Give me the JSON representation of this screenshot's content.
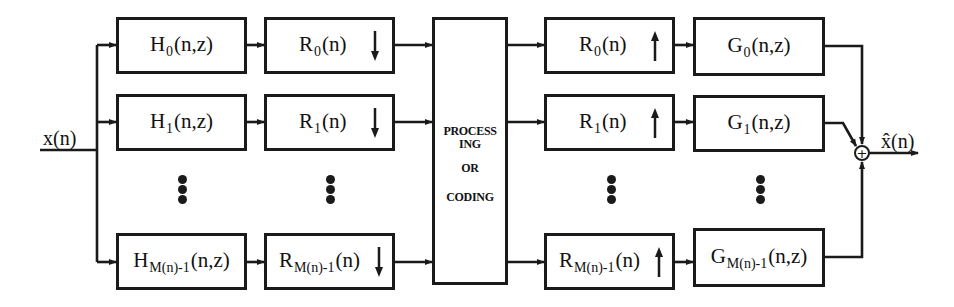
{
  "input": {
    "label": "x(n)"
  },
  "output": {
    "label": "x̂(n)"
  },
  "analysis_filters": [
    {
      "base": "H",
      "sub": "0",
      "args": "(n,z)"
    },
    {
      "base": "H",
      "sub": "1",
      "args": "(n,z)"
    },
    {
      "base": "H",
      "sub": "M(n)-1",
      "args": "(n,z)"
    }
  ],
  "decimators": [
    {
      "base": "R",
      "sub": "0",
      "args": "(n)",
      "direction": "down"
    },
    {
      "base": "R",
      "sub": "1",
      "args": "(n)",
      "direction": "down"
    },
    {
      "base": "R",
      "sub": "M(n)-1",
      "args": "(n)",
      "direction": "down"
    }
  ],
  "processing": {
    "lines": [
      "PROCESS",
      "ING",
      "OR",
      "CODING"
    ]
  },
  "interpolators": [
    {
      "base": "R",
      "sub": "0",
      "args": "(n)",
      "direction": "up"
    },
    {
      "base": "R",
      "sub": "1",
      "args": "(n)",
      "direction": "up"
    },
    {
      "base": "R",
      "sub": "M(n)-1",
      "args": "(n)",
      "direction": "up"
    }
  ],
  "synthesis_filters": [
    {
      "base": "G",
      "sub": "0",
      "args": "(n,z)"
    },
    {
      "base": "G",
      "sub": "1",
      "args": "(n,z)"
    },
    {
      "base": "G",
      "sub": "M(n)-1",
      "args": "(n,z)"
    }
  ],
  "summer": {
    "symbol": "+"
  },
  "ellipsis": "⋮",
  "colors": {
    "ink": "#1a1a1a",
    "background": "#ffffff"
  }
}
